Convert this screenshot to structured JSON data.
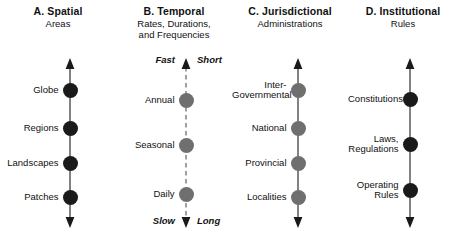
{
  "figure": {
    "background": "#ffffff",
    "width": 458,
    "height": 247
  },
  "columns": [
    {
      "id": "spatial",
      "heading": {
        "title": "A. Spatial",
        "subtitle_lines": [
          "Areas"
        ]
      },
      "axis": {
        "style": "solid",
        "color": "#6d6d6d",
        "arrow_top": true,
        "arrow_bottom": true,
        "x": 70,
        "top": 58,
        "bottom": 228
      },
      "dot_color": "#1a1a1a",
      "dot_diameter": 15,
      "nodes": [
        {
          "label": "Globe",
          "y": 90
        },
        {
          "label": "Regions",
          "y": 128
        },
        {
          "label": "Landscapes",
          "y": 163
        },
        {
          "label": "Patches",
          "y": 197
        }
      ],
      "captions": []
    },
    {
      "id": "temporal",
      "heading": {
        "title": "B. Temporal",
        "subtitle_lines": [
          "Rates, Durations,",
          "and Frequencies"
        ]
      },
      "axis": {
        "style": "dashed",
        "color": "#8a8a8a",
        "arrow_top": true,
        "arrow_bottom": true,
        "x": 186,
        "top": 58,
        "bottom": 228
      },
      "dot_color": "#6f6f6f",
      "dot_diameter": 15,
      "nodes": [
        {
          "label": "Annual",
          "y": 100
        },
        {
          "label": "Seasonal",
          "y": 145
        },
        {
          "label": "Daily",
          "y": 194
        }
      ],
      "captions": [
        {
          "text": "Fast",
          "position": "top-left"
        },
        {
          "text": "Short",
          "position": "top-right"
        },
        {
          "text": "Slow",
          "position": "bottom-left"
        },
        {
          "text": "Long",
          "position": "bottom-right"
        }
      ]
    },
    {
      "id": "jurisdictional",
      "heading": {
        "title": "C. Jurisdictional",
        "subtitle_lines": [
          "Administrations"
        ]
      },
      "axis": {
        "style": "solid",
        "color": "#6d6d6d",
        "arrow_top": true,
        "arrow_bottom": true,
        "x": 298,
        "top": 58,
        "bottom": 228
      },
      "dot_color": "#6f6f6f",
      "dot_diameter": 15,
      "nodes": [
        {
          "label": "Inter-\nGovernmental",
          "y": 90,
          "lines": [
            "Inter-",
            "Governmental"
          ]
        },
        {
          "label": "National",
          "y": 128,
          "lines": [
            "National"
          ]
        },
        {
          "label": "Provincial",
          "y": 163,
          "lines": [
            "Provincial"
          ]
        },
        {
          "label": "Localities",
          "y": 197,
          "lines": [
            "Localities"
          ]
        }
      ],
      "captions": []
    },
    {
      "id": "institutional",
      "heading": {
        "title": "D. Institutional",
        "subtitle_lines": [
          "Rules"
        ]
      },
      "axis": {
        "style": "solid",
        "color": "#6d6d6d",
        "arrow_top": true,
        "arrow_bottom": true,
        "x": 410,
        "top": 58,
        "bottom": 228
      },
      "dot_color": "#1a1a1a",
      "dot_diameter": 15,
      "nodes": [
        {
          "label": "Constitutions",
          "y": 99,
          "lines": [
            "Constitutions"
          ]
        },
        {
          "label": "Laws,\nRegulations",
          "y": 144,
          "lines": [
            "Laws,",
            "Regulations"
          ]
        },
        {
          "label": "Operating\nRules",
          "y": 190,
          "lines": [
            "Operating",
            "Rules"
          ]
        }
      ],
      "captions": []
    }
  ]
}
